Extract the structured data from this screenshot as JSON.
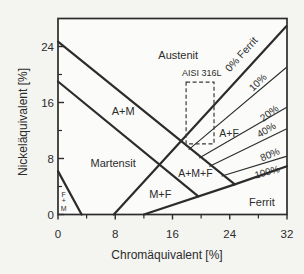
{
  "figure": {
    "ink": "#2c2c2c",
    "background": "#f4f4f1",
    "plot_background": "#fbfbf9"
  },
  "chart_data": {
    "type": "line",
    "xlabel": "Chromäquivalent [%]",
    "ylabel": "Nickeläquivalent [%]",
    "xlim": [
      0,
      32
    ],
    "ylim": [
      0,
      28
    ],
    "x_ticks_major": [
      0,
      8,
      16,
      24,
      32
    ],
    "x_ticks_minor": [
      4,
      12,
      20,
      28
    ],
    "y_ticks_major": [
      0,
      8,
      16,
      24
    ],
    "y_ticks_minor": [
      4,
      12,
      20
    ],
    "grid": false,
    "boundary_lines": [
      {
        "name": "austenite-a-m-boundary",
        "weight": "thick",
        "points": [
          [
            0,
            24.7
          ],
          [
            24.7,
            4.3
          ]
        ]
      },
      {
        "name": "a-m-martensite-boundary",
        "weight": "thick",
        "points": [
          [
            0,
            19.0
          ],
          [
            19.6,
            2.6
          ]
        ]
      },
      {
        "name": "zero-ferrite-line",
        "weight": "thick",
        "points": [
          [
            7.8,
            0
          ],
          [
            31.9,
            26.9
          ]
        ]
      },
      {
        "name": "ferrite-100-boundary",
        "weight": "thick",
        "points": [
          [
            12.0,
            0
          ],
          [
            24.7,
            4.3
          ],
          [
            32,
            6.9
          ]
        ]
      },
      {
        "name": "f-m-triangle-hypotenuse",
        "weight": "thick",
        "points": [
          [
            0,
            6.2
          ],
          [
            3.3,
            0
          ]
        ]
      },
      {
        "name": "ferrite-10-line",
        "weight": "thin",
        "points": [
          [
            18.3,
            9.3
          ],
          [
            31.9,
            21.0
          ]
        ]
      },
      {
        "name": "ferrite-20-line",
        "weight": "thin",
        "points": [
          [
            19.8,
            8.1
          ],
          [
            31.9,
            15.3
          ]
        ]
      },
      {
        "name": "ferrite-40-line",
        "weight": "thin",
        "points": [
          [
            21.2,
            6.9
          ],
          [
            31.9,
            12.2
          ]
        ]
      },
      {
        "name": "ferrite-80-line",
        "weight": "thin",
        "points": [
          [
            22.9,
            5.5
          ],
          [
            31.9,
            8.3
          ]
        ]
      }
    ],
    "region_labels": [
      {
        "text": "Austenit",
        "x": 16.8,
        "y": 22.8,
        "size": 11
      },
      {
        "text": "A+M",
        "x": 9.1,
        "y": 14.8,
        "size": 11
      },
      {
        "text": "Martensit",
        "x": 7.7,
        "y": 7.3,
        "size": 11
      },
      {
        "text": "M+F",
        "x": 14.3,
        "y": 2.9,
        "size": 11
      },
      {
        "text": "A+M+F",
        "x": 19.2,
        "y": 5.9,
        "size": 10.5
      },
      {
        "text": "A+F",
        "x": 23.9,
        "y": 11.6,
        "size": 10.5
      },
      {
        "text": "Ferrit",
        "x": 28.5,
        "y": 1.8,
        "size": 11
      },
      {
        "text": "F",
        "x": 0.8,
        "y": 2.9,
        "size": 7
      },
      {
        "text": "+",
        "x": 0.8,
        "y": 1.95,
        "size": 7
      },
      {
        "text": "M",
        "x": 0.8,
        "y": 0.85,
        "size": 7
      }
    ],
    "percent_labels": [
      {
        "text": "0% Ferrit",
        "x": 25.6,
        "y": 22.9,
        "rot": -48,
        "size": 10.5
      },
      {
        "text": "10%",
        "x": 27.9,
        "y": 18.9,
        "rot": -44,
        "size": 10
      },
      {
        "text": "20%",
        "x": 29.5,
        "y": 14.5,
        "rot": -37,
        "size": 10
      },
      {
        "text": "40%",
        "x": 29.1,
        "y": 12.1,
        "rot": -31,
        "size": 10
      },
      {
        "text": "80%",
        "x": 29.6,
        "y": 8.6,
        "rot": -23,
        "size": 10
      },
      {
        "text": "100%",
        "x": 29.2,
        "y": 6.1,
        "rot": -16,
        "size": 10
      }
    ],
    "annotation_box": {
      "label": "AISI 316L",
      "x1": 17.9,
      "y1": 10.1,
      "x2": 21.8,
      "y2": 18.9,
      "label_x": 20.1,
      "label_y": 20.2,
      "label_size": 9
    }
  }
}
